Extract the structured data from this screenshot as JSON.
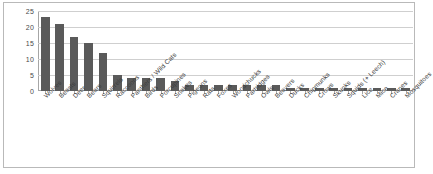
{
  "chart_data": {
    "type": "bar",
    "title": "",
    "subtitle": "",
    "xlabel": "",
    "ylabel": "",
    "ylim": [
      0,
      25
    ],
    "yticks": [
      0,
      5,
      10,
      15,
      20,
      25
    ],
    "grid": true,
    "legend": false,
    "legend_position": "none",
    "bar_color": "#5a5a5a",
    "background_color": "#ffffff",
    "gridline_color": "#cfcfcf",
    "axis_color": "#a6a6a6",
    "label_rotation": -45,
    "categories": [
      "Wolves",
      "Beasts",
      "Deer",
      "Bears",
      "Squirrels",
      "Raccoons",
      "Panthers / Wild Cats",
      "Birds",
      "Porcupines",
      "Snakes",
      "Pigeons",
      "Rats",
      "Foxes",
      "Woodchucks",
      "Partridges",
      "Owls",
      "Beavers",
      "Ducks",
      "Chipmunks",
      "Crows",
      "Skunks",
      "Squids (+ Leech)",
      "Lice",
      "Mice",
      "Cranes",
      "Mosquitoes"
    ],
    "values": [
      23,
      21,
      17,
      15,
      12,
      5,
      4,
      4,
      4,
      3,
      2,
      2,
      2,
      2,
      2,
      2,
      2,
      1,
      1,
      1,
      1,
      1,
      1,
      1,
      1,
      1
    ]
  }
}
